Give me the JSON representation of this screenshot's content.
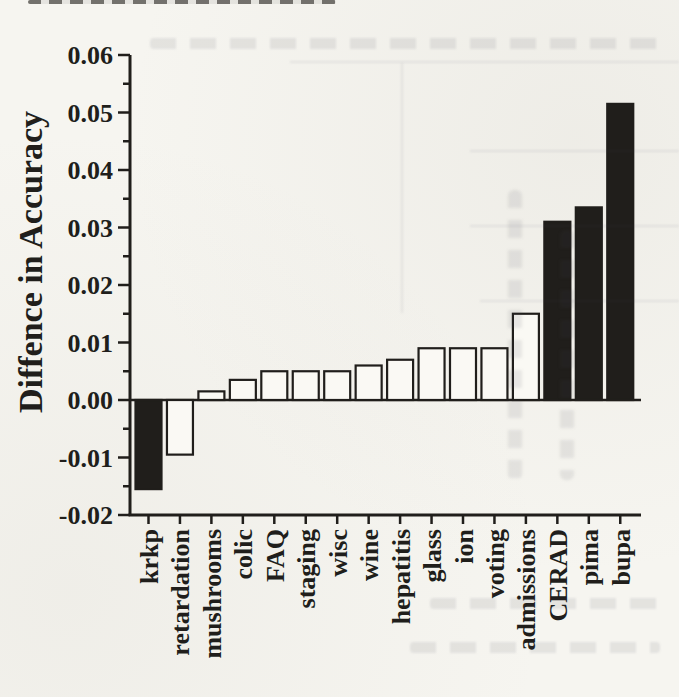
{
  "figure": {
    "kind": "scanned-paper-bar-chart",
    "ink_color": "#201e1b",
    "paper_color": "#f6f5f0",
    "bar_fill_white": "#faf9f4",
    "bar_fill_black": "#201e1b"
  },
  "chart_data": {
    "type": "bar",
    "title": "",
    "xlabel": "",
    "ylabel": "Diffence in Accuracy",
    "ylim": [
      -0.02,
      0.06
    ],
    "grid": false,
    "legend_position": "none",
    "categories": [
      "krkp",
      "retardation",
      "mushrooms",
      "colic",
      "FAQ",
      "staging",
      "wisc",
      "wine",
      "hepatitis",
      "glass",
      "ion",
      "voting",
      "admissions",
      "CERAD",
      "pima",
      "bupa"
    ],
    "values": [
      -0.0155,
      -0.0095,
      0.0015,
      0.0035,
      0.005,
      0.005,
      0.005,
      0.006,
      0.007,
      0.009,
      0.009,
      0.009,
      0.015,
      0.031,
      0.0335,
      0.0515
    ],
    "bar_filled_black": [
      true,
      false,
      false,
      false,
      false,
      false,
      false,
      false,
      false,
      false,
      false,
      false,
      false,
      true,
      true,
      true
    ],
    "yticks": [
      {
        "label": "0.06",
        "value": 0.06
      },
      {
        "label": "0.05",
        "value": 0.05
      },
      {
        "label": "0.04",
        "value": 0.04
      },
      {
        "label": "0.03",
        "value": 0.03
      },
      {
        "label": "0.02",
        "value": 0.02
      },
      {
        "label": "0.01",
        "value": 0.01
      },
      {
        "label": "0.00",
        "value": 0.0
      },
      {
        "label": "-0.01",
        "value": -0.01
      },
      {
        "label": "-0.02",
        "value": -0.02
      }
    ],
    "minor_ytick_values": [
      0.055,
      0.045,
      0.035,
      0.025,
      0.015,
      0.005,
      -0.005,
      -0.015
    ],
    "x_labels_rotation_deg": -90
  }
}
